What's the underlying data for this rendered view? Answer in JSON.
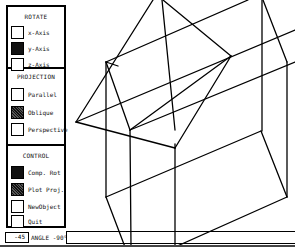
{
  "panel": {
    "rotate": {
      "title": "ROTATE",
      "options": [
        {
          "label": "x-Axis",
          "state": "off"
        },
        {
          "label": "y-Axis",
          "state": "on"
        },
        {
          "label": "z-Axis",
          "state": "off"
        }
      ]
    },
    "projection": {
      "title": "PROJECTION",
      "options": [
        {
          "label": "Parallel",
          "state": "off"
        },
        {
          "label": "Oblique",
          "state": "on"
        },
        {
          "label": "Perspective",
          "state": "off"
        }
      ]
    },
    "control": {
      "title": "CONTROL",
      "options": [
        {
          "label": "Comp. Rot",
          "state": "on"
        },
        {
          "label": "Plot Proj.",
          "state": "on"
        },
        {
          "label": "NewObject",
          "state": "off"
        },
        {
          "label": "Quit",
          "state": "off"
        }
      ]
    }
  },
  "angle": {
    "value": "-45",
    "label": "ANGLE -90°"
  },
  "colors": {
    "foreground": "#000000",
    "background": "#ffffff"
  }
}
